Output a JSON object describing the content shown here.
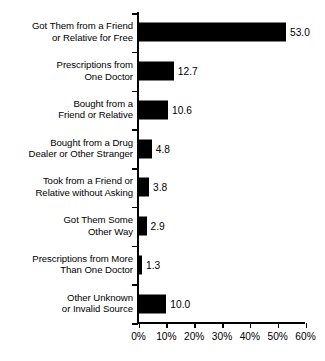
{
  "chart_data": {
    "type": "bar",
    "orientation": "horizontal",
    "title": "",
    "subtitle": "",
    "xlabel": "",
    "ylabel": "",
    "xlim": [
      0,
      60
    ],
    "xtick_values": [
      0,
      10,
      20,
      30,
      40,
      50,
      60
    ],
    "xtick_labels": [
      "0%",
      "10%",
      "20%",
      "30%",
      "40%",
      "50%",
      "60%"
    ],
    "grid": false,
    "legend": null,
    "bar_color": "#000000",
    "background_color": "#ffffff",
    "text_color": "#000000",
    "categories": [
      "Got Them from a Friend or Relative for Free",
      "Prescriptions from One Doctor",
      "Bought from a Friend or Relative",
      "Bought from a Drug Dealer or Other Stranger",
      "Took from a Friend or Relative without Asking",
      "Got Them Some Other Way",
      "Prescriptions from More Than One Doctor",
      "Other Unknown or Invalid Source"
    ],
    "values": [
      53.0,
      12.7,
      10.6,
      4.8,
      3.8,
      2.9,
      1.3,
      10.0
    ],
    "data_labels": [
      "53.0",
      "12.7",
      "10.6",
      "4.8",
      "3.8",
      "2.9",
      "1.3",
      "10.0"
    ],
    "bars": [
      {
        "label_line1": "Got Them from a Friend",
        "label_line2": "or Relative for Free",
        "value": 53.0,
        "data_label": "53.0"
      },
      {
        "label_line1": "Prescriptions from",
        "label_line2": "One Doctor",
        "value": 12.7,
        "data_label": "12.7"
      },
      {
        "label_line1": "Bought from a",
        "label_line2": "Friend or Relative",
        "value": 10.6,
        "data_label": "10.6"
      },
      {
        "label_line1": "Bought from a Drug",
        "label_line2": "Dealer or Other Stranger",
        "value": 4.8,
        "data_label": "4.8"
      },
      {
        "label_line1": "Took from a Friend or",
        "label_line2": "Relative without Asking",
        "value": 3.8,
        "data_label": "3.8"
      },
      {
        "label_line1": "Got Them Some",
        "label_line2": "Other Way",
        "value": 2.9,
        "data_label": "2.9"
      },
      {
        "label_line1": "Prescriptions from More",
        "label_line2": "Than One Doctor",
        "value": 1.3,
        "data_label": "1.3"
      },
      {
        "label_line1": "Other Unknown",
        "label_line2": "or Invalid Source",
        "value": 10.0,
        "data_label": "10.0"
      }
    ]
  }
}
